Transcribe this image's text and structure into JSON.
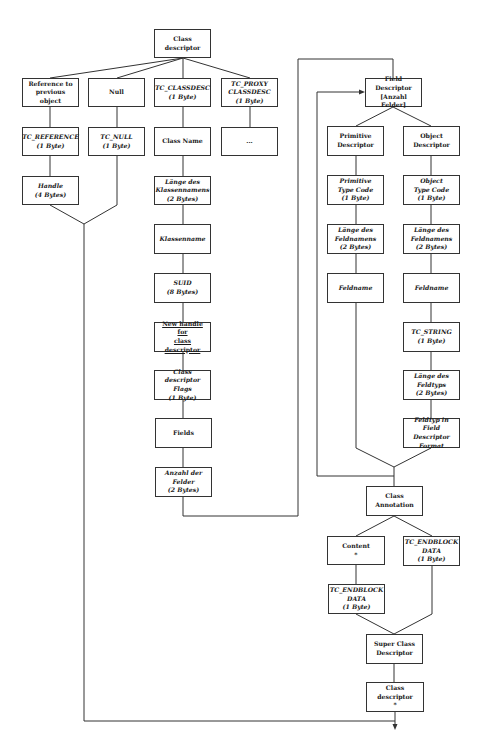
{
  "diagram": {
    "type": "flowchart",
    "colors": {
      "stroke": "#333333",
      "background": "#ffffff",
      "text": "#1a1a1a"
    },
    "nodes": {
      "class_descriptor": "Class descriptor",
      "reference": "Reference to\nprevious object",
      "null": "Null",
      "tc_classdesc": "TC_CLASSDESC\n(1 Byte)",
      "tc_proxy": "TC_PROXY\nCLASSDESC\n(1 Byte)",
      "tc_reference": "TC_REFERENCE\n(1 Byte)",
      "tc_null": "TC_NULL\n(1 Byte)",
      "class_name": "Class Name",
      "ellipsis": "...",
      "handle": "Handle\n(4 Bytes)",
      "laenge_klassennamens": "Länge des\nKlassennamens\n(2 Bytes)",
      "klassenname": "Klassenname",
      "suid": "SUID\n(8 Bytes)",
      "new_handle": "New handle for\nclass descriptor",
      "flags": "Class descriptor\nFlags\n(1 Byte)",
      "fields": "Fields",
      "anzahl_felder": "Anzahl der\nFelder\n(2 Bytes)",
      "field_descriptor": "Field Descriptor\n[Anzahl Felder]",
      "primitive_descriptor": "Primitive\nDescriptor",
      "object_descriptor": "Object\nDescriptor",
      "primitive_type_code": "Primitive\nType Code\n(1 Byte)",
      "object_type_code": "Object\nType Code\n(1 Byte)",
      "laenge_feldnamens_p": "Länge des\nFeldnamens\n(2 Bytes)",
      "laenge_feldnamens_o": "Länge des\nFeldnamens\n(2 Bytes)",
      "feldname_p": "Feldname",
      "feldname_o": "Feldname",
      "tc_string": "TC_STRING\n(1 Byte)",
      "laenge_feldtyps": "Länge des\nFeldtyps\n(2 Bytes)",
      "feldtyp_format": "Feldtyp in Field\nDescriptor\nFormat",
      "class_annotation": "Class\nAnnotation",
      "content": "Content\n*",
      "tc_endblock_right": "TC_ENDBLOCK\nDATA\n(1 Byte)",
      "tc_endblock_left": "TC_ENDBLOCK\nDATA\n(1 Byte)",
      "super_class": "Super Class\nDescriptor",
      "class_descriptor_end": "Class descriptor\n*"
    }
  }
}
